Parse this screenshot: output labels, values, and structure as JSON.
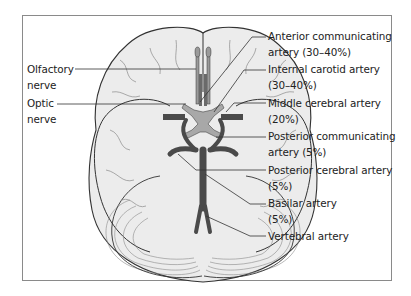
{
  "figure": {
    "type": "anatomical-diagram",
    "colors": {
      "brain_fill": "#ececec",
      "brain_outline": "#333333",
      "gyri_lines": "#8a8a8a",
      "artery_dark": "#4a4a4a",
      "artery_light": "#9a9a9a",
      "leader_line": "#333333",
      "frame": "#8a8a8a"
    }
  },
  "labels_left": [
    {
      "id": "olfactory",
      "line1": "Olfactory",
      "line2": "nerve"
    },
    {
      "id": "optic",
      "line1": "Optic",
      "line2": "nerve"
    }
  ],
  "labels_right": [
    {
      "id": "acom",
      "line1": "Anterior communicating",
      "line2": "artery (30–40%)"
    },
    {
      "id": "ica",
      "line1": "Internal carotid artery",
      "line2": "(30–40%)"
    },
    {
      "id": "mca",
      "line1": "Middle cerebral artery",
      "line2": "(20%)"
    },
    {
      "id": "pcom",
      "line1": "Posterior communicating",
      "line2": "artery (5%)"
    },
    {
      "id": "pca",
      "line1": "Posterior cerebral artery",
      "line2": "(5%)"
    },
    {
      "id": "basilar",
      "line1": "Basilar artery",
      "line2": "(5%)"
    },
    {
      "id": "vertebral",
      "line1": "Vertebral artery",
      "line2": ""
    }
  ]
}
